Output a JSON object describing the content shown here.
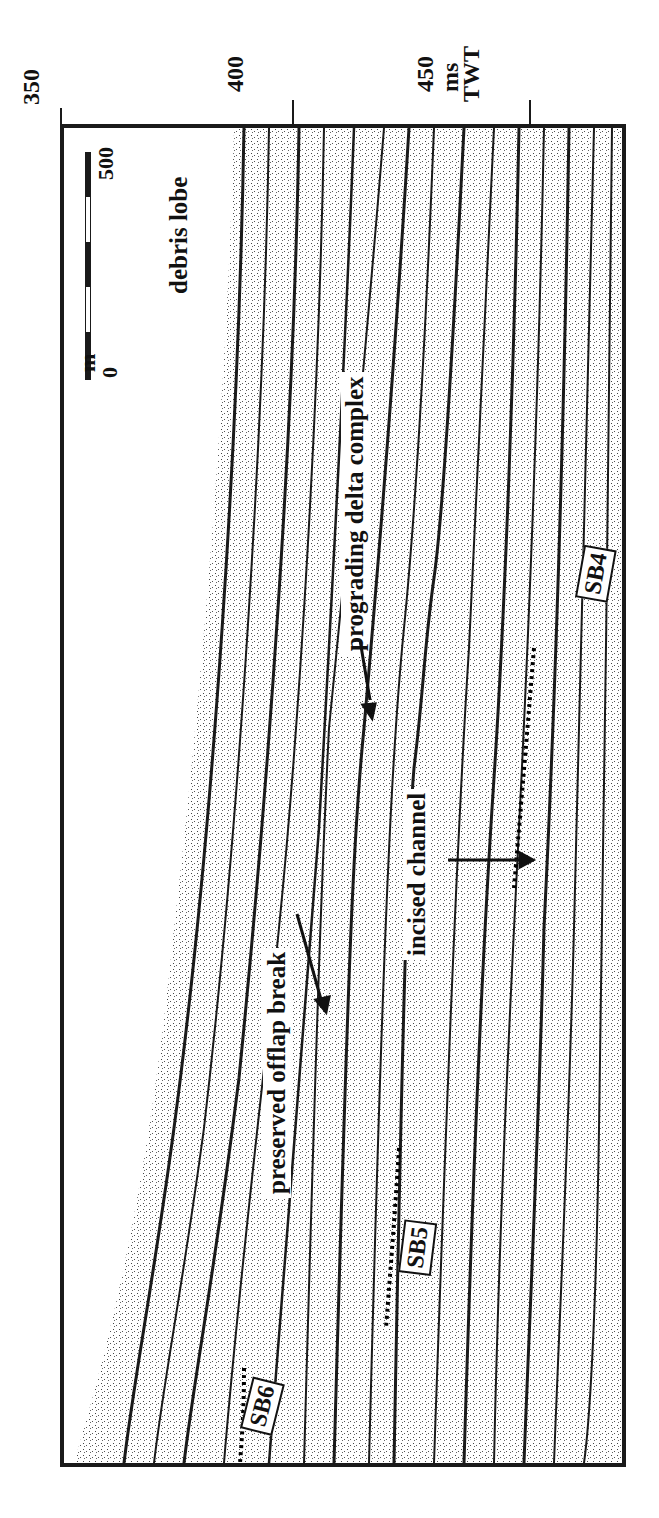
{
  "figure": {
    "axis": {
      "unit_label": "ms",
      "axis_title": "TWT",
      "ticks": [
        {
          "label": "350",
          "pos_x": 62
        },
        {
          "label": "400",
          "pos_x": 293
        },
        {
          "label": "450",
          "pos_x": 530
        }
      ]
    },
    "scale_bar": {
      "unit": "m",
      "start": "0",
      "end": "500"
    },
    "annotations": {
      "debris_lobe": "debris lobe",
      "prograding_delta_complex": "prograding delta complex",
      "preserved_offlap_break": "preserved offlap break",
      "incised_channel": "incised channel"
    },
    "sequence_boundaries": [
      "SB4",
      "SB5",
      "SB6"
    ],
    "colors": {
      "ink": "#1a1a1a",
      "background": "#ffffff"
    }
  }
}
